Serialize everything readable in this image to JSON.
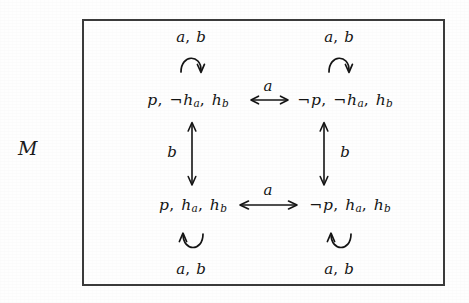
{
  "figure": {
    "model_label": "M",
    "border_color": "#3a3a3a",
    "ink_color": "#141414"
  },
  "states": [
    {
      "id": "top-left",
      "text": "p, ¬hₐ, h_b",
      "parts": {
        "p": "p",
        "neg": "¬",
        "h_a": "h",
        "sub_a": "a",
        "h_b": "h",
        "sub_b": "b"
      }
    },
    {
      "id": "top-right",
      "text": "¬p, ¬hₐ, h_b"
    },
    {
      "id": "bottom-left",
      "text": "p, hₐ, h_b"
    },
    {
      "id": "bottom-right",
      "text": "¬p, hₐ, h_b"
    }
  ],
  "state_text": {
    "top_left": {
      "seg1": "p",
      "comma1": ",",
      "neg1": "¬",
      "h1": "h",
      "sub1": "a",
      "comma2": ",",
      "h2": "h",
      "sub2": "b"
    },
    "top_right": {
      "neg0": "¬",
      "seg1": "p",
      "comma1": ",",
      "neg1": "¬",
      "h1": "h",
      "sub1": "a",
      "comma2": ",",
      "h2": "h",
      "sub2": "b"
    },
    "bottom_left": {
      "seg1": "p",
      "comma1": ",",
      "h1": "h",
      "sub1": "a",
      "comma2": ",",
      "h2": "h",
      "sub2": "b"
    },
    "bottom_right": {
      "neg0": "¬",
      "seg1": "p",
      "comma1": ",",
      "h1": "h",
      "sub1": "a",
      "comma2": ",",
      "h2": "h",
      "sub2": "b"
    }
  },
  "loops": [
    {
      "id": "loop-top-left",
      "label_a": "a",
      "comma": ",",
      "label_b": "b",
      "direction": "up"
    },
    {
      "id": "loop-top-right",
      "label_a": "a",
      "comma": ",",
      "label_b": "b",
      "direction": "up"
    },
    {
      "id": "loop-bottom-left",
      "label_a": "a",
      "comma": ",",
      "label_b": "b",
      "direction": "down"
    },
    {
      "id": "loop-bottom-right",
      "label_a": "a",
      "comma": ",",
      "label_b": "b",
      "direction": "down"
    }
  ],
  "edges": [
    {
      "id": "edge-top-horizontal",
      "label": "a",
      "kind": "bidirectional-horizontal"
    },
    {
      "id": "edge-bottom-horizontal",
      "label": "a",
      "kind": "bidirectional-horizontal"
    },
    {
      "id": "edge-left-vertical",
      "label": "b",
      "kind": "bidirectional-vertical"
    },
    {
      "id": "edge-right-vertical",
      "label": "b",
      "kind": "bidirectional-vertical"
    }
  ]
}
